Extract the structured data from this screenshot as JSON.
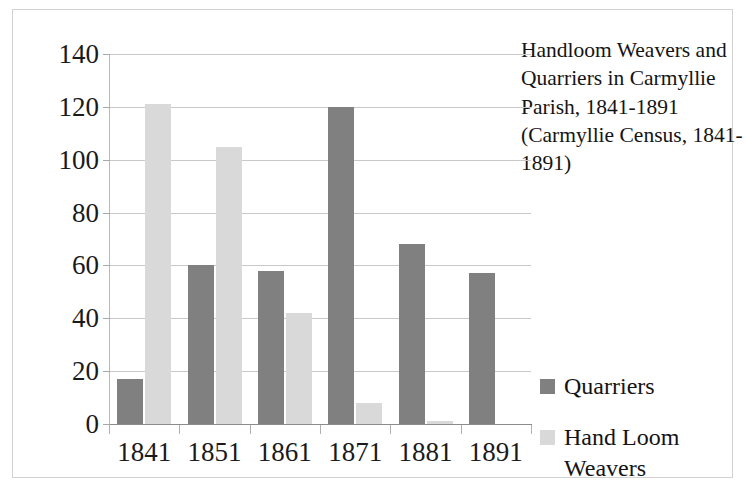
{
  "chart_data": {
    "type": "bar",
    "title": "Handloom Weavers and Quarriers in Carmyllie Parish, 1841-1891\n(Carmyllie Census, 1841-1891)",
    "title_lines": [
      "Handloom Weavers",
      "and Quarriers in",
      "Carmyllie Parish,",
      "1841-1891",
      "(Carmyllie Census,",
      "1841-1891)"
    ],
    "subtitle": "",
    "xlabel": "",
    "ylabel": "",
    "categories": [
      "1841",
      "1851",
      "1861",
      "1871",
      "1881",
      "1891"
    ],
    "series": [
      {
        "name": "Quarriers",
        "color": "#808080",
        "values": [
          17,
          60,
          58,
          120,
          68,
          57
        ]
      },
      {
        "name": "Hand Loom Weavers",
        "color": "#d9d9d9",
        "values": [
          121,
          105,
          42,
          8,
          1,
          0
        ]
      }
    ],
    "ylim": [
      0,
      140
    ],
    "ytick_values": [
      0,
      20,
      40,
      60,
      80,
      100,
      120,
      140
    ],
    "ytick_labels": [
      "0",
      "20",
      "40",
      "60",
      "80",
      "100",
      "120",
      "140"
    ],
    "grid": true,
    "grid_axis": "y",
    "legend_position": "right",
    "legend": [
      {
        "label": "Quarriers",
        "color": "#808080"
      },
      {
        "label": "Hand Loom\nWeavers",
        "color": "#d9d9d9"
      }
    ],
    "plot_background": "#ffffff",
    "gridline_color": "#c8c8c8",
    "border_color": "#d2d2d2"
  }
}
